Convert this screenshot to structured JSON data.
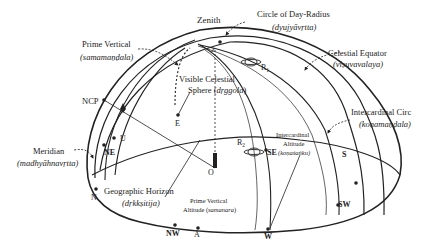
{
  "labels": {
    "zenith": "Zenith",
    "day_radius": "Circle of Day-Radius",
    "day_radius_sk": "(dyujyāvṛtta)",
    "prime_vertical": "Prime Vertical",
    "prime_vertical_sk": "(samamaṇḍala)",
    "celestial_equator": "Celestial Equator",
    "celestial_equator_sk": "(viṣuvavalaya)",
    "visible_sphere_1": "Visible Celestial",
    "visible_sphere_2": "Sphere (",
    "visible_sphere_sk": "dṛggola",
    "visible_sphere_end": ")",
    "ncp": "NCP",
    "intercardinal_circle": "Intercardinal Circ",
    "intercardinal_circle_sk": "(koṇamaṇḍala)",
    "meridian": "Meridian",
    "meridian_sk": "(madhyāhnavṛtta)",
    "intercardinal_alt_1": "Intercardinal",
    "intercardinal_alt_2": "Altitude",
    "intercardinal_alt_sk": "(koṇaśaṅku)",
    "geo_horizon": "Geographic Horizon",
    "geo_horizon_sk": "(dṛkkṣitija)",
    "pv_alt_1": "Prime Vertical",
    "pv_alt_2": "Altitude (",
    "pv_alt_sk": "samanara",
    "pv_alt_end": ")",
    "points": {
      "E": "E",
      "U": "U",
      "NE": "NE",
      "N": "N",
      "NW": "NW",
      "A": "A",
      "W": "W",
      "SW": "SW",
      "S": "S",
      "SE": "SE",
      "O": "O",
      "Z": "Z",
      "R1": "R",
      "R1_sub": "1",
      "R2": "R",
      "R2_sub": "2"
    }
  },
  "colors": {
    "line": "#222222",
    "background": "#ffffff"
  }
}
